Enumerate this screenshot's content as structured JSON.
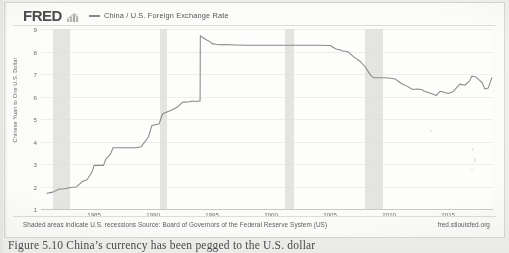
{
  "header": {
    "logo_text": "FRED",
    "logo_icon": "bar-chart-icon",
    "legend_label": "China / U.S. Foreign Exchange Rate",
    "legend_color": "#8a8a8a"
  },
  "footer": {
    "note": "Shaded areas indicate U.S. recessions Source: Board of Governors of the Federal Reserve System (US)",
    "source_url": "fred.stlouisfed.org"
  },
  "caption": {
    "text": "Figure 5.10   China’s currency has been pegged to the U.S. dollar"
  },
  "chart_data": {
    "type": "line",
    "title": "China / U.S. Foreign Exchange Rate",
    "xlabel": "",
    "ylabel": "Chinese Yuan to One U.S. Dollar",
    "xlim": [
      1980.5,
      2018.8
    ],
    "ylim": [
      1,
      9
    ],
    "yticks": [
      9,
      8,
      7,
      6,
      5,
      4,
      3,
      2,
      1
    ],
    "xticks": [
      1985,
      1990,
      1995,
      2000,
      2005,
      2010,
      2015
    ],
    "grid": true,
    "legend_position": "top",
    "line_color": "#8a8a8a",
    "series": [
      {
        "name": "China / U.S. Foreign Exchange Rate",
        "units": "Chinese Yuan to One U.S. Dollar",
        "x": [
          1981.0,
          1981.5,
          1982.0,
          1982.5,
          1983.0,
          1983.5,
          1984.0,
          1984.4,
          1984.8,
          1985.0,
          1985.3,
          1985.8,
          1986.0,
          1986.4,
          1986.6,
          1987.0,
          1987.5,
          1988.0,
          1988.5,
          1989.0,
          1989.6,
          1989.9,
          1990.0,
          1990.5,
          1990.8,
          1991.0,
          1991.5,
          1992.0,
          1992.5,
          1993.0,
          1993.3,
          1993.6,
          1993.9,
          1993.98,
          1994.0,
          1994.2,
          1994.5,
          1994.8,
          1995.0,
          1995.3,
          1995.6,
          1996.0,
          1996.5,
          1997.0,
          1998.0,
          1999.0,
          2000.0,
          2001.0,
          2002.0,
          2003.0,
          2004.0,
          2005.0,
          2005.5,
          2005.8,
          2006.0,
          2006.5,
          2007.0,
          2007.5,
          2008.0,
          2008.4,
          2008.7,
          2009.0,
          2009.5,
          2010.0,
          2010.5,
          2011.0,
          2011.5,
          2012.0,
          2012.4,
          2012.8,
          2013.0,
          2013.5,
          2014.0,
          2014.3,
          2014.6,
          2015.0,
          2015.4,
          2015.7,
          2016.0,
          2016.4,
          2016.8,
          2017.0,
          2017.3,
          2017.6,
          2017.9,
          2018.1,
          2018.4,
          2018.7
        ],
        "y": [
          1.7,
          1.75,
          1.88,
          1.9,
          1.96,
          1.98,
          2.22,
          2.3,
          2.62,
          2.94,
          2.94,
          2.94,
          3.22,
          3.45,
          3.72,
          3.72,
          3.72,
          3.72,
          3.72,
          3.77,
          4.2,
          4.72,
          4.72,
          4.78,
          5.22,
          5.28,
          5.38,
          5.51,
          5.75,
          5.76,
          5.8,
          5.78,
          5.8,
          5.8,
          8.7,
          8.62,
          8.52,
          8.44,
          8.35,
          8.32,
          8.3,
          8.31,
          8.3,
          8.29,
          8.28,
          8.28,
          8.28,
          8.28,
          8.28,
          8.28,
          8.28,
          8.27,
          8.11,
          8.08,
          8.03,
          7.99,
          7.76,
          7.58,
          7.3,
          6.96,
          6.83,
          6.83,
          6.83,
          6.82,
          6.78,
          6.59,
          6.46,
          6.31,
          6.33,
          6.3,
          6.23,
          6.14,
          6.05,
          6.23,
          6.2,
          6.13,
          6.21,
          6.38,
          6.55,
          6.5,
          6.68,
          6.9,
          6.88,
          6.75,
          6.6,
          6.33,
          6.38,
          6.83
        ]
      }
    ],
    "recession_bands": [
      {
        "start": 1981.55,
        "end": 1982.92,
        "label": "1981-82 recession"
      },
      {
        "start": 1990.55,
        "end": 1991.2,
        "label": "1990-91 recession"
      },
      {
        "start": 2001.2,
        "end": 2001.9,
        "label": "2001 recession"
      },
      {
        "start": 2007.95,
        "end": 2009.45,
        "label": "2008-09 recession"
      }
    ],
    "shaded_note": "Shaded areas indicate U.S. recessions"
  }
}
